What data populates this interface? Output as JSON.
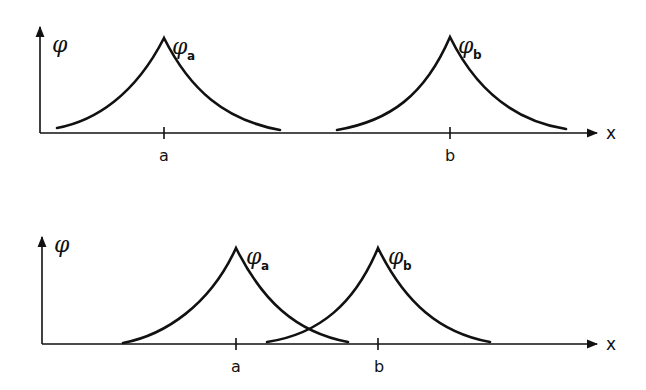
{
  "figure": {
    "top_panel": {
      "y_axis_label": "φ",
      "x_axis_label": "x",
      "ticks": [
        {
          "label": "a",
          "x": 164
        },
        {
          "label": "b",
          "x": 450
        }
      ],
      "curves": [
        {
          "name": "φ",
          "subscript": "a",
          "peak_x": 164,
          "peak_y": 38,
          "left_x": 57,
          "right_x": 280
        },
        {
          "name": "φ",
          "subscript": "b",
          "peak_x": 450,
          "peak_y": 37,
          "left_x": 337,
          "right_x": 566
        }
      ],
      "baseline_y": 133
    },
    "bottom_panel": {
      "y_axis_label": "φ",
      "x_axis_label": "x",
      "ticks": [
        {
          "label": "a",
          "x": 236
        },
        {
          "label": "b",
          "x": 378
        }
      ],
      "curves": [
        {
          "name": "φ",
          "subscript": "a",
          "peak_x": 236,
          "peak_y": 248,
          "left_x": 123,
          "right_x": 348
        },
        {
          "name": "φ",
          "subscript": "b",
          "peak_x": 378,
          "peak_y": 248,
          "left_x": 267,
          "right_x": 490
        }
      ],
      "baseline_y": 344
    }
  }
}
